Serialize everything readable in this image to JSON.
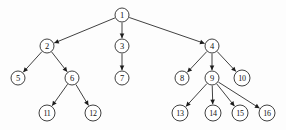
{
  "diagram": {
    "type": "directed-tree",
    "canvas": {
      "width": 286,
      "height": 130,
      "background": "#fdfdfd"
    },
    "style": {
      "node_fill": "#ffffff",
      "node_stroke": "#2b2b2b",
      "edge_color": "#2b2b2b",
      "label_color": "#111111",
      "node_radius_single_digit": 7,
      "node_radius_double_digit": 8
    },
    "nodes": [
      {
        "id": "n1",
        "label": "1",
        "x": 122,
        "y": 15,
        "r": 7,
        "level": 0
      },
      {
        "id": "n2",
        "label": "2",
        "x": 47,
        "y": 46,
        "r": 7,
        "level": 1
      },
      {
        "id": "n3",
        "label": "3",
        "x": 122,
        "y": 46,
        "r": 7,
        "level": 1
      },
      {
        "id": "n4",
        "label": "4",
        "x": 212,
        "y": 46,
        "r": 7,
        "level": 1
      },
      {
        "id": "n5",
        "label": "5",
        "x": 18,
        "y": 78,
        "r": 7,
        "level": 2
      },
      {
        "id": "n6",
        "label": "6",
        "x": 72,
        "y": 78,
        "r": 7,
        "level": 2
      },
      {
        "id": "n7",
        "label": "7",
        "x": 122,
        "y": 78,
        "r": 7,
        "level": 2
      },
      {
        "id": "n8",
        "label": "8",
        "x": 182,
        "y": 78,
        "r": 7,
        "level": 2
      },
      {
        "id": "n9",
        "label": "9",
        "x": 212,
        "y": 78,
        "r": 7,
        "level": 2
      },
      {
        "id": "n10",
        "label": "10",
        "x": 242,
        "y": 78,
        "r": 8,
        "level": 2
      },
      {
        "id": "n11",
        "label": "11",
        "x": 47,
        "y": 113,
        "r": 8,
        "level": 3
      },
      {
        "id": "n12",
        "label": "12",
        "x": 93,
        "y": 113,
        "r": 8,
        "level": 3
      },
      {
        "id": "n13",
        "label": "13",
        "x": 180,
        "y": 113,
        "r": 8,
        "level": 3
      },
      {
        "id": "n14",
        "label": "14",
        "x": 213,
        "y": 113,
        "r": 8,
        "level": 3
      },
      {
        "id": "n15",
        "label": "15",
        "x": 240,
        "y": 113,
        "r": 8,
        "level": 3
      },
      {
        "id": "n16",
        "label": "16",
        "x": 267,
        "y": 113,
        "r": 8,
        "level": 3
      }
    ],
    "edges": [
      {
        "id": "e1-2",
        "from": "n1",
        "to": "n2",
        "directed": true
      },
      {
        "id": "e1-3",
        "from": "n1",
        "to": "n3",
        "directed": true
      },
      {
        "id": "e1-4",
        "from": "n1",
        "to": "n4",
        "directed": true
      },
      {
        "id": "e2-5",
        "from": "n2",
        "to": "n5",
        "directed": true
      },
      {
        "id": "e2-6",
        "from": "n2",
        "to": "n6",
        "directed": true
      },
      {
        "id": "e3-7",
        "from": "n3",
        "to": "n7",
        "directed": true
      },
      {
        "id": "e4-8",
        "from": "n4",
        "to": "n8",
        "directed": true
      },
      {
        "id": "e4-9",
        "from": "n4",
        "to": "n9",
        "directed": true
      },
      {
        "id": "e4-10",
        "from": "n4",
        "to": "n10",
        "directed": true
      },
      {
        "id": "e6-11",
        "from": "n6",
        "to": "n11",
        "directed": true
      },
      {
        "id": "e6-12",
        "from": "n6",
        "to": "n12",
        "directed": true
      },
      {
        "id": "e9-13",
        "from": "n9",
        "to": "n13",
        "directed": true
      },
      {
        "id": "e9-14",
        "from": "n9",
        "to": "n14",
        "directed": true
      },
      {
        "id": "e9-15",
        "from": "n9",
        "to": "n15",
        "directed": true
      },
      {
        "id": "e9-16",
        "from": "n9",
        "to": "n16",
        "directed": true
      }
    ]
  }
}
